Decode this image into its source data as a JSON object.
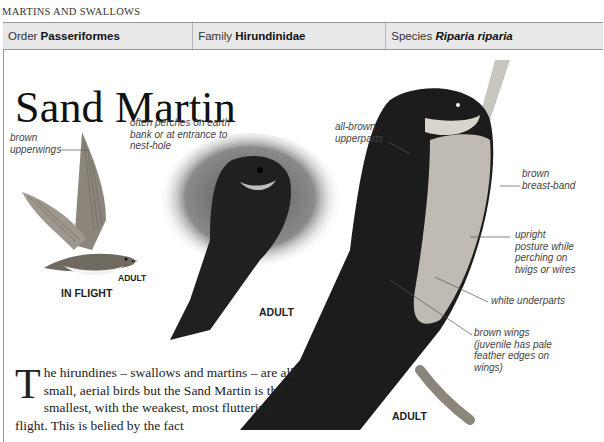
{
  "section": {
    "title": "MARTINS AND SWALLOWS"
  },
  "taxonomy": {
    "order_label": "Order",
    "order_value": "Passeriformes",
    "family_label": "Family",
    "family_value": "Hirundinidae",
    "species_label": "Species",
    "species_value": "Riparia riparia"
  },
  "page_title": "Sand Martin",
  "illustrations": {
    "flight": {
      "caption_adult": "ADULT",
      "caption_view": "IN FLIGHT",
      "annotation": "brown upperwings"
    },
    "nest": {
      "caption": "ADULT",
      "annotation": "often perches on earth bank or at entrance to nest-hole"
    },
    "perched": {
      "caption": "ADULT",
      "annotations": [
        "all-brown upperparts",
        "brown breast-band",
        "upright posture while perching on twigs or wires",
        "white underparts",
        "brown wings (juvenile has pale feather edges on wings)"
      ]
    }
  },
  "body": {
    "dropcap": "T",
    "text": "he hirundines – swallows and martins – are all small, aerial birds but the Sand Martin is the smallest, with the weakest, most fluttering flight. This is belied by the fact"
  },
  "colors": {
    "header_bg": "#e8e8e8",
    "border": "#9a9a9a",
    "text": "#222222"
  }
}
